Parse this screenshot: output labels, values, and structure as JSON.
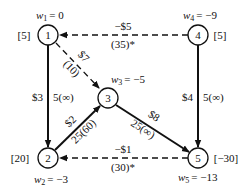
{
  "diagram": {
    "type": "network-flow",
    "nodes": [
      {
        "id": "1",
        "label": "1",
        "supply": "[5]",
        "potential": "w₁ = 0",
        "potential_name": "w",
        "potential_sub": "1",
        "potential_value": "= 0"
      },
      {
        "id": "2",
        "label": "2",
        "supply": "[20]",
        "potential": "w₂ = −3",
        "potential_name": "w",
        "potential_sub": "2",
        "potential_value": "= −3"
      },
      {
        "id": "3",
        "label": "3",
        "supply": "",
        "potential": "w₃ = −5",
        "potential_name": "w",
        "potential_sub": "3",
        "potential_value": "= −5"
      },
      {
        "id": "4",
        "label": "4",
        "supply": "[5]",
        "potential": "w₄ = −9",
        "potential_name": "w",
        "potential_sub": "4",
        "potential_value": "= −9"
      },
      {
        "id": "5",
        "label": "5",
        "supply": "[−30]",
        "potential": "w₅ = −13",
        "potential_name": "w",
        "potential_sub": "5",
        "potential_value": "= −13"
      }
    ],
    "edges": [
      {
        "from": "1",
        "to": "2",
        "style": "solid",
        "cost": "$3",
        "flow": "5(∞)"
      },
      {
        "from": "1",
        "to": "3",
        "style": "dashed",
        "cost": "$7",
        "flow": "(10)"
      },
      {
        "from": "4",
        "to": "1",
        "style": "dashed",
        "cost": "−$5",
        "flow": "(35)*"
      },
      {
        "from": "4",
        "to": "5",
        "style": "solid",
        "cost": "$4",
        "flow": "5(∞)"
      },
      {
        "from": "2",
        "to": "3",
        "style": "solid",
        "cost": "$2",
        "flow": "25(60)"
      },
      {
        "from": "3",
        "to": "5",
        "style": "solid",
        "cost": "$8",
        "flow": "25(∞)"
      },
      {
        "from": "5",
        "to": "2",
        "style": "dashed",
        "cost": "−$1",
        "flow": "(30)*"
      }
    ]
  }
}
